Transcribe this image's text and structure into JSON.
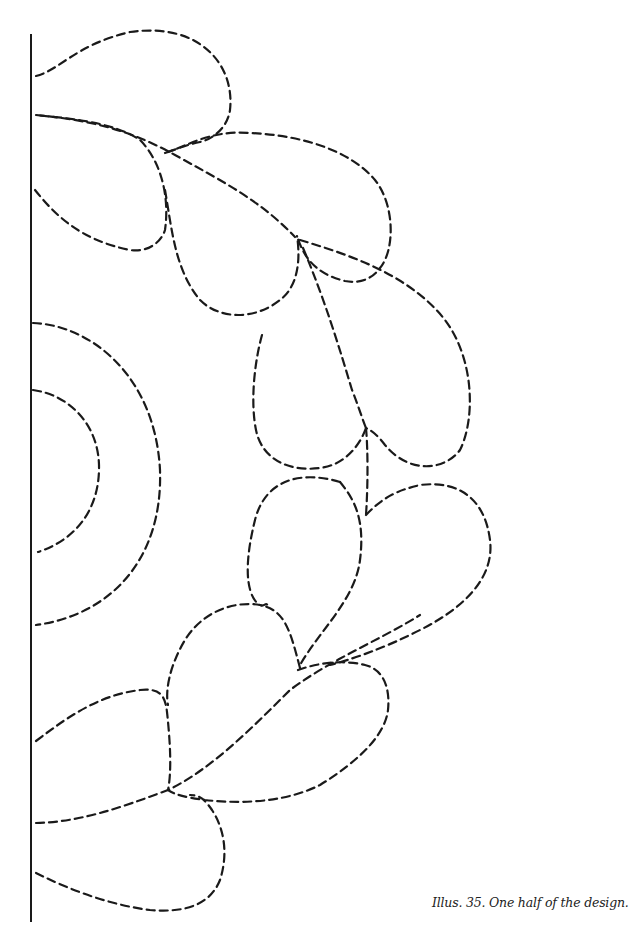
{
  "figure": {
    "caption": "Illus. 35. One half of the design.",
    "line_color": "#1a1a1a",
    "background_color": "#ffffff",
    "line_style": "dashed",
    "elements": {
      "center_line": "solid vertical fold line on left edge",
      "inner_semicircle": "dashed half-circle at center-left",
      "outer_semicircle": "dashed concentric half-circle around inner semicircle",
      "teardrop_petals": 14
    }
  }
}
